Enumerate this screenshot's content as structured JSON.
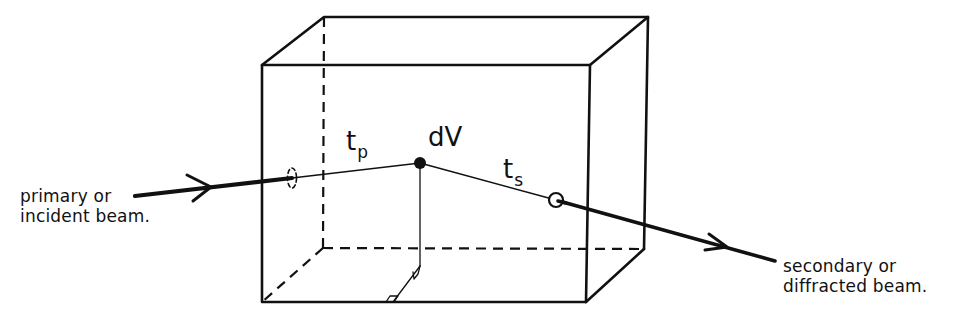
{
  "diagram": {
    "type": "geometry-schematic",
    "colors": {
      "stroke": "#111111",
      "background": "#ffffff"
    },
    "labels": {
      "incident_line1": "primary or",
      "incident_line2": "incident beam.",
      "diffracted_line1": "secondary or",
      "diffracted_line2": "diffracted beam.",
      "volume_element": "dV",
      "path_primary_main": "t",
      "path_primary_sub": "p",
      "path_secondary_main": "t",
      "path_secondary_sub": "s"
    },
    "elements": [
      "rectangular-box (crystal)",
      "incident-beam-arrow",
      "entry-point-ellipse",
      "volume-element-dot",
      "exit-point-circle",
      "diffracted-beam-arrow",
      "perpendicular-drop-line",
      "right-angle-markers"
    ]
  }
}
